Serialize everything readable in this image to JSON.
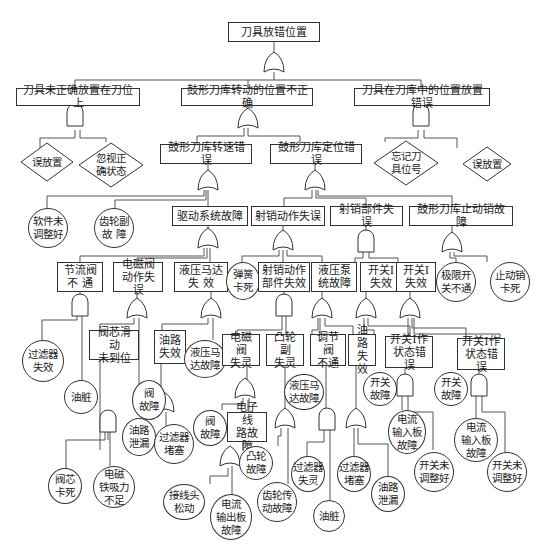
{
  "title": "刀具放错位置",
  "level1": [
    {
      "label": "刀具未正确放置在刀位上",
      "gate": "AND"
    },
    {
      "label": "鼓形刀库转动的位置不正确",
      "gate": "OR"
    },
    {
      "label": "刀具在刀库中的位置放置错误",
      "gate": "AND"
    }
  ],
  "top_gate": "OR",
  "diamonds": [
    {
      "label": "误放置"
    },
    {
      "label": "忽视正\n确状态"
    },
    {
      "label": "忘记刀\n具位号"
    },
    {
      "label": "误放置"
    }
  ],
  "level2": [
    {
      "label": "鼓形刀库转速错误",
      "gate": "OR"
    },
    {
      "label": "鼓形刀库定位错误",
      "gate": "OR"
    }
  ],
  "level3": [
    {
      "label": "软件未\n调整好",
      "type": "circle"
    },
    {
      "label": "齿轮副\n故  障",
      "type": "circle"
    },
    {
      "label": "驱动系统故障",
      "type": "box",
      "gate": "OR"
    },
    {
      "label": "射销动作失误",
      "type": "box",
      "gate": "OR"
    },
    {
      "label": "射销部件失误",
      "type": "box",
      "gate": "AND"
    },
    {
      "label": "鼓形刀库止动销故障",
      "type": "box",
      "gate": "OR"
    }
  ],
  "level4": [
    {
      "label": "节流阀\n不  通",
      "gate": "AND"
    },
    {
      "label": "电磁阀\n动作失误",
      "gate": "OR"
    },
    {
      "label": "液压马达\n失    效",
      "gate": "OR"
    },
    {
      "label": "弹簧\n卡死",
      "type": "circle"
    },
    {
      "label": "射销动作\n部件失效",
      "gate": "AND"
    },
    {
      "label": "液压泵\n统故障",
      "gate": "OR"
    },
    {
      "label": "开关Ⅰ\n失效",
      "gate": "OR"
    },
    {
      "label": "开关Ⅰ\n失效",
      "gate": "OR"
    },
    {
      "label": "极限开\n关不通",
      "type": "circle"
    },
    {
      "label": "止动销\n卡死",
      "type": "circle"
    }
  ],
  "level5": [
    {
      "label": "过滤器\n失效",
      "type": "circle"
    },
    {
      "label": "油脏",
      "type": "circle"
    },
    {
      "label": "阀芯滑动\n未到位",
      "type": "box",
      "gate": "AND"
    },
    {
      "label": "阀\n故障",
      "type": "circle"
    },
    {
      "label": "油路\n失效",
      "type": "box",
      "gate": "OR"
    },
    {
      "label": "液压马\n达故障",
      "type": "circle"
    },
    {
      "label": "电磁阀\n失灵",
      "type": "box",
      "gate": "OR"
    },
    {
      "label": "凸轮副\n失灵",
      "type": "box",
      "gate": "OR"
    },
    {
      "label": "液压马\n达故障",
      "type": "circle"
    },
    {
      "label": "调节阀\n不通",
      "type": "box",
      "gate": "AND"
    },
    {
      "label": "油路\n失效",
      "type": "box",
      "gate": "OR"
    },
    {
      "label": "开关Ⅰ作\n状态错误",
      "type": "box",
      "gate": "AND"
    },
    {
      "label": "开关\n故障",
      "type": "circle"
    },
    {
      "label": "开关\n故障",
      "type": "circle"
    },
    {
      "label": "开关Ⅰ作\n状态错误",
      "type": "box",
      "gate": "AND"
    }
  ],
  "level6": [
    {
      "label": "阀芯\n卡死",
      "type": "circle"
    },
    {
      "label": "电磁\n铁吸力\n不足",
      "type": "circle"
    },
    {
      "label": "油路\n泄漏",
      "type": "circle"
    },
    {
      "label": "过滤器\n堵塞",
      "type": "circle"
    },
    {
      "label": "阀\n故障",
      "type": "circle"
    },
    {
      "label": "电子线\n路故障",
      "type": "box",
      "gate": "OR"
    },
    {
      "label": "凸轮\n故障",
      "type": "circle"
    },
    {
      "label": "齿轮传\n动故障",
      "type": "circle"
    },
    {
      "label": "过滤器\n失灵",
      "type": "circle"
    },
    {
      "label": "油脏",
      "type": "circle"
    },
    {
      "label": "过滤器\n堵塞",
      "type": "circle"
    },
    {
      "label": "油路\n泄漏",
      "type": "circle"
    },
    {
      "label": "电流\n输入板\n故障",
      "type": "circle"
    },
    {
      "label": "开关未\n调整好",
      "type": "circle"
    },
    {
      "label": "电流\n输入板\n故障",
      "type": "circle"
    },
    {
      "label": "开关未\n调整好",
      "type": "circle"
    }
  ],
  "level7": [
    {
      "label": "接线头\n松动",
      "type": "circle"
    },
    {
      "label": "电流\n输出板\n故障",
      "type": "circle"
    }
  ]
}
